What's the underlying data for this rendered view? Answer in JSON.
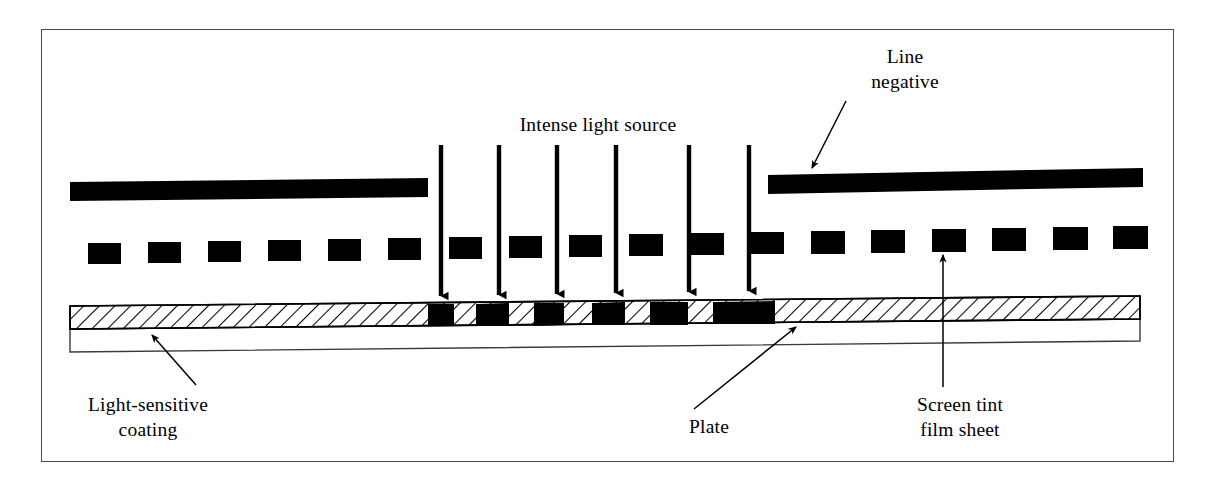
{
  "diagram": {
    "title_visible": false,
    "labels": {
      "intense_light_source": "Intense light source",
      "line_negative": "Line\nnegative",
      "light_sensitive_coating": "Light-sensitive\ncoating",
      "plate": "Plate",
      "screen_tint_film_sheet": "Screen tint\nfilm sheet"
    },
    "colors": {
      "ink": "#000000",
      "frame": "#4a4a4a",
      "paper": "#ffffff",
      "hatch": "#000000"
    },
    "frame": {
      "x": 41,
      "y": 29,
      "width": 1133,
      "height": 433
    },
    "line_negative_bars": [
      {
        "name": "left-bar",
        "x": 70,
        "y": 180,
        "width": 358,
        "height": 19,
        "tilt": -1.2
      },
      {
        "name": "right-bar",
        "x": 768,
        "y": 171,
        "width": 375,
        "height": 19,
        "tilt": -1.0
      }
    ],
    "screen_tint_dashes": {
      "count": 18,
      "y": 234,
      "width": 33,
      "height": 22,
      "start_x": 88,
      "pitch": 59
    },
    "light_rays": {
      "count": 6,
      "top_y": 145,
      "tip_y": 303,
      "x_positions": [
        441,
        499,
        557,
        616,
        689,
        749
      ]
    },
    "plate": {
      "left": 70,
      "right": 1140,
      "coating_top_left": 306,
      "coating_top_right": 297,
      "coating_bottom_left": 329,
      "coating_bottom_right": 319,
      "body_bottom_left": 352,
      "body_bottom_right": 341
    },
    "exposed_segments": [
      {
        "x": 428,
        "width": 26
      },
      {
        "x": 476,
        "width": 33
      },
      {
        "x": 534,
        "width": 30
      },
      {
        "x": 592,
        "width": 33
      },
      {
        "x": 650,
        "width": 38
      },
      {
        "x": 713,
        "width": 35
      },
      {
        "x": 748,
        "width": 27
      }
    ],
    "leader_lines": [
      {
        "name": "line-negative-leader",
        "x1": 845,
        "y1": 100,
        "x2": 812,
        "y2": 166
      },
      {
        "name": "coating-leader",
        "x1": 193,
        "y1": 384,
        "x2": 150,
        "y2": 336
      },
      {
        "name": "plate-leader",
        "x1": 696,
        "y1": 408,
        "x2": 796,
        "y2": 330
      },
      {
        "name": "screen-tint-leader",
        "x1": 943,
        "y1": 386,
        "x2": 943,
        "y2": 256
      }
    ]
  }
}
